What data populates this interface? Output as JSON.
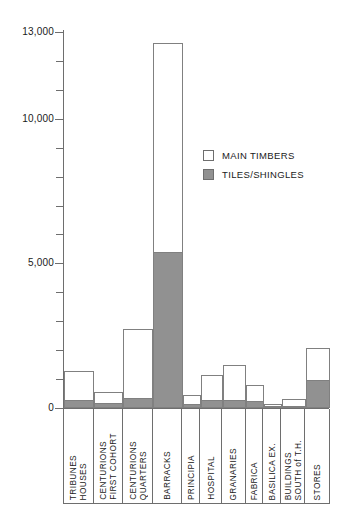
{
  "chart_data": {
    "type": "bar",
    "subtype": "stacked-vertical",
    "title": "",
    "xlabel": "",
    "ylabel": "",
    "ylim": [
      0,
      13000
    ],
    "grid": false,
    "y_tick_labels": [
      "0",
      "5,000",
      "10,000",
      "13,000"
    ],
    "y_ticks_major": [
      0,
      5000,
      10000,
      13000
    ],
    "y_ticks_minor": [
      1000,
      2000,
      3000,
      4000,
      6000,
      7000,
      8000,
      9000,
      11000,
      12000
    ],
    "legend": {
      "position": "inside-upper-right",
      "entries": [
        {
          "label": "MAIN TIMBERS",
          "color": "#ffffff",
          "swatch": "white-square"
        },
        {
          "label": "TILES/SHINGLES",
          "color": "#919191",
          "swatch": "gray-square"
        }
      ]
    },
    "categories": [
      "TRIBUNES HOUSES",
      "CENTURIONS FIRST COHORT",
      "CENTURIONS QUARTERS",
      "BARRACKS",
      "PRINCIPIA",
      "HOSPITAL",
      "GRANARIES",
      "FABRICA",
      "BASILICA EX.",
      "BUILDINGS SOUTH of T.H.",
      "STORES"
    ],
    "category_label_lines": [
      [
        "TRIBUNES",
        "HOUSES"
      ],
      [
        "CENTURIONS",
        "FIRST COHORT"
      ],
      [
        "CENTURIONS",
        "QUARTERS"
      ],
      [
        "BARRACKS"
      ],
      [
        "PRINCIPIA"
      ],
      [
        "HOSPITAL"
      ],
      [
        "GRANARIES"
      ],
      [
        "FABRICA"
      ],
      [
        "BASILICA EX."
      ],
      [
        "BUILDINGS",
        "SOUTH of T.H."
      ],
      [
        "STORES"
      ]
    ],
    "series": [
      {
        "name": "TILES/SHINGLES",
        "color": "#919191",
        "values": [
          280,
          170,
          345,
          5390,
          140,
          280,
          280,
          240,
          70,
          70,
          970
        ]
      },
      {
        "name": "MAIN TIMBERS",
        "color": "#ffffff",
        "values": [
          1000,
          380,
          2385,
          7230,
          310,
          860,
          1210,
          555,
          70,
          240,
          1100
        ]
      }
    ],
    "totals": [
      1280,
      550,
      2730,
      12620,
      450,
      1140,
      1490,
      795,
      140,
      310,
      2070
    ]
  },
  "axis": {
    "y_labels": [
      {
        "value": 13000,
        "text": "13,000"
      },
      {
        "value": 10000,
        "text": "10,000"
      },
      {
        "value": 5000,
        "text": "5,000"
      },
      {
        "value": 0,
        "text": "0"
      }
    ]
  },
  "colors": {
    "timbers": "#ffffff",
    "tiles": "#919191",
    "stroke": "#6e6e6e",
    "bar_stroke": "#808080",
    "text": "#1a1a1a",
    "background": "#ffffff"
  }
}
